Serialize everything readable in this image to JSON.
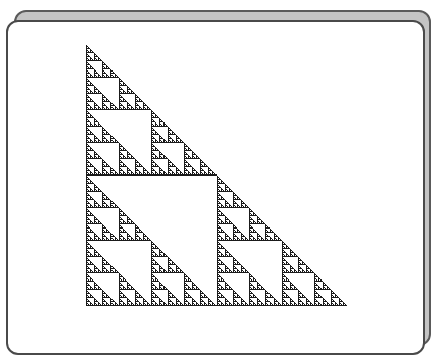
{
  "figure": {
    "orientation": "right-angle-bottom-left",
    "levels": 8,
    "grid_size": 256,
    "fill_color": "#1a1a1a",
    "background_color": "#ffffff",
    "panel_color": "#ffffff",
    "back_panel_color": "#c4c4c4",
    "border_color": "#4a4a4a"
  }
}
